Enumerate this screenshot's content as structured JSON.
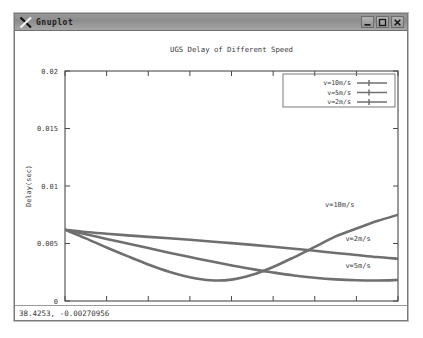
{
  "window": {
    "title": "Gnuplot",
    "logo_icon": "gnuplot-x-logo",
    "buttons": {
      "minimize": "minimize-icon",
      "maximize": "maximize-icon",
      "close": "close-icon"
    }
  },
  "statusbar": {
    "coordinates": "38.4253, -0.00270956"
  },
  "chart_data": {
    "type": "line",
    "title": "UGS Delay of Different Speed",
    "xlabel": "Simulation Time(s)",
    "ylabel": "Delay(sec)",
    "xlim": [
      0,
      40
    ],
    "ylim": [
      0,
      0.02
    ],
    "xticks": [
      "0",
      "5",
      "10",
      "15",
      "20",
      "25",
      "30",
      "35",
      "40"
    ],
    "xtick_values": [
      0,
      5,
      10,
      15,
      20,
      25,
      30,
      35,
      40
    ],
    "yticks": [
      "0",
      "0.005",
      "0.01",
      "0.015",
      "0.02"
    ],
    "ytick_values": [
      0,
      0.005,
      0.01,
      0.015,
      0.02
    ],
    "grid": false,
    "legend_position": "top-right",
    "line_color": "#6f6f6f",
    "x": [
      0,
      2.5,
      5,
      7.5,
      10,
      12.5,
      15,
      17.5,
      20,
      22.5,
      25,
      27.5,
      30,
      32.5,
      35,
      37.5,
      40
    ],
    "series": [
      {
        "name": "v=10m/s",
        "legend_label": "v=10m/s",
        "inplot_label": "v=10m/s",
        "values": [
          0.0062,
          0.00545,
          0.00465,
          0.0039,
          0.00318,
          0.00255,
          0.00207,
          0.0018,
          0.00186,
          0.00228,
          0.00296,
          0.0038,
          0.0047,
          0.00562,
          0.0063,
          0.00695,
          0.0075
        ]
      },
      {
        "name": "v=5m/s",
        "legend_label": "v=5m/s",
        "inplot_label": "v=5m/s",
        "values": [
          0.0062,
          0.0058,
          0.0054,
          0.005,
          0.0046,
          0.0042,
          0.00382,
          0.00345,
          0.0031,
          0.00277,
          0.00248,
          0.00222,
          0.00202,
          0.00188,
          0.0018,
          0.00178,
          0.00182
        ]
      },
      {
        "name": "v=2m/s",
        "legend_label": "v=2m/s",
        "inplot_label": "v=2m/s",
        "values": [
          0.0062,
          0.006,
          0.00585,
          0.00571,
          0.00558,
          0.00545,
          0.00532,
          0.00518,
          0.00503,
          0.00488,
          0.00472,
          0.00455,
          0.00437,
          0.00418,
          0.004,
          0.00382,
          0.00368
        ]
      }
    ]
  }
}
